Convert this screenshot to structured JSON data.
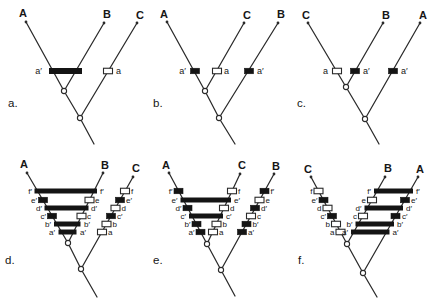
{
  "figure": {
    "colors": {
      "line": "#2a2a2a",
      "black_mark": "#141414",
      "open_mark_fill": "#ffffff",
      "background": "#ffffff"
    },
    "character_rows": {
      "f": 191,
      "e": 200,
      "d": 208,
      "c": 216,
      "b": 224,
      "a": 232
    },
    "panels": [
      {
        "id": "a",
        "row": "top",
        "letter": {
          "t": "a.",
          "x": 8,
          "y": 107
        },
        "tips": [
          {
            "t": "A",
            "tx": 23,
            "ty": 17,
            "px": 26,
            "py": 22
          },
          {
            "t": "B",
            "tx": 107,
            "ty": 18,
            "px": 104,
            "py": 23
          },
          {
            "t": "C",
            "tx": 140,
            "ty": 19,
            "px": 137,
            "py": 23
          }
        ],
        "edges": [
          [
            26,
            22,
            64,
            91
          ],
          [
            104,
            23,
            64,
            91
          ],
          [
            64,
            91,
            80,
            118
          ],
          [
            137,
            23,
            80,
            118
          ],
          [
            80,
            118,
            94,
            144
          ]
        ],
        "nodes": [
          [
            64,
            91
          ],
          [
            80,
            118
          ]
        ],
        "bars": [
          {
            "x1": 49,
            "x2": 82,
            "y": 71,
            "h": 6
          }
        ],
        "marks": [
          {
            "k": "o",
            "x": 108,
            "y": 71
          }
        ],
        "labels": [
          {
            "t": "a′",
            "x": 42,
            "y": 74,
            "a": "e"
          },
          {
            "t": "a",
            "x": 116,
            "y": 74,
            "a": "s"
          }
        ]
      },
      {
        "id": "b",
        "row": "top",
        "letter": {
          "t": "b.",
          "x": 153,
          "y": 107
        },
        "tips": [
          {
            "t": "A",
            "tx": 164,
            "ty": 18,
            "px": 167,
            "py": 22
          },
          {
            "t": "C",
            "tx": 247,
            "ty": 19,
            "px": 244,
            "py": 23
          },
          {
            "t": "B",
            "tx": 281,
            "ty": 18,
            "px": 278,
            "py": 23
          }
        ],
        "edges": [
          [
            167,
            22,
            205,
            91
          ],
          [
            244,
            23,
            205,
            91
          ],
          [
            205,
            91,
            219,
            118
          ],
          [
            278,
            23,
            219,
            118
          ],
          [
            219,
            118,
            235,
            144
          ]
        ],
        "nodes": [
          [
            205,
            91
          ],
          [
            219,
            118
          ]
        ],
        "bars": [],
        "marks": [
          {
            "k": "b",
            "x": 195,
            "y": 71
          },
          {
            "k": "o",
            "x": 217,
            "y": 71
          },
          {
            "k": "b",
            "x": 249,
            "y": 71
          }
        ],
        "labels": [
          {
            "t": "a′",
            "x": 186,
            "y": 74,
            "a": "e"
          },
          {
            "t": "a",
            "x": 224,
            "y": 74,
            "a": "s"
          },
          {
            "t": "a′",
            "x": 257,
            "y": 74,
            "a": "s"
          }
        ]
      },
      {
        "id": "c",
        "row": "top",
        "letter": {
          "t": "c.",
          "x": 297,
          "y": 107
        },
        "tips": [
          {
            "t": "C",
            "tx": 306,
            "ty": 19,
            "px": 308,
            "py": 23
          },
          {
            "t": "B",
            "tx": 386,
            "ty": 19,
            "px": 383,
            "py": 23
          },
          {
            "t": "A",
            "tx": 423,
            "ty": 19,
            "px": 420,
            "py": 23
          }
        ],
        "edges": [
          [
            308,
            23,
            346,
            87
          ],
          [
            383,
            23,
            346,
            87
          ],
          [
            346,
            87,
            365,
            119
          ],
          [
            420,
            23,
            365,
            119
          ],
          [
            365,
            119,
            379,
            144
          ]
        ],
        "nodes": [
          [
            346,
            87
          ],
          [
            365,
            119
          ]
        ],
        "bars": [],
        "marks": [
          {
            "k": "o",
            "x": 337,
            "y": 71
          },
          {
            "k": "b",
            "x": 355,
            "y": 71
          },
          {
            "k": "b",
            "x": 393,
            "y": 71
          }
        ],
        "labels": [
          {
            "t": "a",
            "x": 328,
            "y": 74,
            "a": "e"
          },
          {
            "t": "a′",
            "x": 363,
            "y": 74,
            "a": "s"
          },
          {
            "t": "a′",
            "x": 401,
            "y": 74,
            "a": "s"
          }
        ]
      },
      {
        "id": "d",
        "row": "bottom",
        "letter": {
          "t": "d.",
          "x": 5,
          "y": 264
        },
        "tips": [
          {
            "t": "A",
            "tx": 24,
            "ty": 168,
            "px": 27,
            "py": 173
          },
          {
            "t": "B",
            "tx": 105,
            "ty": 169,
            "px": 103,
            "py": 173
          },
          {
            "t": "C",
            "tx": 136,
            "ty": 172,
            "px": 133,
            "py": 177
          }
        ],
        "edges": [
          [
            27,
            173,
            68,
            243
          ],
          [
            103,
            173,
            68,
            243
          ],
          [
            68,
            243,
            81,
            269
          ],
          [
            133,
            177,
            81,
            269
          ],
          [
            81,
            269,
            97,
            297
          ]
        ],
        "nodes": [
          [
            68,
            243
          ],
          [
            81,
            269
          ]
        ],
        "bars": [
          {
            "x1": 34.5,
            "x2": 97,
            "y": 191
          },
          {
            "x1": 44.5,
            "x2": 88.5,
            "y": 208
          },
          {
            "x1": 54,
            "x2": 80.5,
            "y": 224
          },
          {
            "x1": 58.5,
            "x2": 76.5,
            "y": 232
          }
        ],
        "marks": [
          {
            "k": "b",
            "x": 43,
            "y": 200
          },
          {
            "k": "b",
            "x": 52,
            "y": 216
          },
          {
            "k": "o",
            "x": 89.5,
            "y": 200
          },
          {
            "k": "o",
            "x": 81.5,
            "y": 216
          },
          {
            "k": "o",
            "x": 125,
            "y": 191
          },
          {
            "k": "b",
            "x": 120,
            "y": 200
          },
          {
            "k": "o",
            "x": 115.5,
            "y": 208
          },
          {
            "k": "b",
            "x": 111,
            "y": 216
          },
          {
            "k": "o",
            "x": 106.5,
            "y": 224
          },
          {
            "k": "o",
            "x": 102,
            "y": 232
          }
        ],
        "labels": [
          {
            "t": "f′",
            "x": 32,
            "y": 194,
            "a": "e"
          },
          {
            "t": "e′",
            "x": 37,
            "y": 203,
            "a": "e"
          },
          {
            "t": "d′",
            "x": 42,
            "y": 211,
            "a": "e"
          },
          {
            "t": "c′",
            "x": 46,
            "y": 219,
            "a": "e"
          },
          {
            "t": "b′",
            "x": 51,
            "y": 227,
            "a": "e"
          },
          {
            "t": "a′",
            "x": 55,
            "y": 235,
            "a": "e"
          },
          {
            "t": "f′",
            "x": 100,
            "y": 194,
            "a": "s"
          },
          {
            "t": "e",
            "x": 95,
            "y": 203,
            "a": "s"
          },
          {
            "t": "d′",
            "x": 91,
            "y": 211,
            "a": "s"
          },
          {
            "t": "c",
            "x": 87,
            "y": 219,
            "a": "s"
          },
          {
            "t": "b′",
            "x": 84,
            "y": 227,
            "a": "s"
          },
          {
            "t": "a′",
            "x": 80,
            "y": 235,
            "a": "s"
          },
          {
            "t": "f",
            "x": 131,
            "y": 194,
            "a": "s"
          },
          {
            "t": "e′",
            "x": 126,
            "y": 203,
            "a": "s"
          },
          {
            "t": "d",
            "x": 121.5,
            "y": 211,
            "a": "s"
          },
          {
            "t": "c′",
            "x": 117,
            "y": 219,
            "a": "s"
          },
          {
            "t": "b",
            "x": 112.5,
            "y": 227,
            "a": "s"
          },
          {
            "t": "a",
            "x": 108,
            "y": 235,
            "a": "s"
          }
        ]
      },
      {
        "id": "e",
        "row": "bottom",
        "letter": {
          "t": "e.",
          "x": 153,
          "y": 264
        },
        "tips": [
          {
            "t": "A",
            "tx": 166,
            "ty": 169,
            "px": 169,
            "py": 173
          },
          {
            "t": "C",
            "tx": 242,
            "ty": 169,
            "px": 240,
            "py": 174
          },
          {
            "t": "B",
            "tx": 276,
            "ty": 170,
            "px": 274,
            "py": 174
          }
        ],
        "edges": [
          [
            169,
            173,
            207,
            244
          ],
          [
            240,
            174,
            207,
            244
          ],
          [
            207,
            244,
            221,
            270
          ],
          [
            274,
            174,
            221,
            270
          ],
          [
            221,
            270,
            235,
            296
          ]
        ],
        "nodes": [
          [
            207,
            244
          ],
          [
            221,
            270
          ]
        ],
        "bars": [
          {
            "x1": 180.5,
            "x2": 231,
            "y": 200
          },
          {
            "x1": 189,
            "x2": 223,
            "y": 216
          }
        ],
        "marks": [
          {
            "k": "b",
            "x": 178.5,
            "y": 191
          },
          {
            "k": "b",
            "x": 187.5,
            "y": 208
          },
          {
            "k": "b",
            "x": 196.5,
            "y": 224
          },
          {
            "k": "b",
            "x": 200.5,
            "y": 232
          },
          {
            "k": "o",
            "x": 232,
            "y": 191
          },
          {
            "k": "o",
            "x": 224,
            "y": 208
          },
          {
            "k": "o",
            "x": 216.5,
            "y": 224
          },
          {
            "k": "o",
            "x": 213,
            "y": 232
          },
          {
            "k": "b",
            "x": 264.5,
            "y": 191
          },
          {
            "k": "o",
            "x": 259.5,
            "y": 200
          },
          {
            "k": "b",
            "x": 255,
            "y": 208
          },
          {
            "k": "o",
            "x": 251,
            "y": 216
          },
          {
            "k": "b",
            "x": 246.5,
            "y": 224
          },
          {
            "k": "b",
            "x": 242,
            "y": 232
          }
        ],
        "labels": [
          {
            "t": "f′",
            "x": 172.5,
            "y": 194,
            "a": "e"
          },
          {
            "t": "e′",
            "x": 177.5,
            "y": 203,
            "a": "e"
          },
          {
            "t": "d′",
            "x": 181.5,
            "y": 211,
            "a": "e"
          },
          {
            "t": "c′",
            "x": 186,
            "y": 219,
            "a": "e"
          },
          {
            "t": "b′",
            "x": 190.5,
            "y": 227,
            "a": "e"
          },
          {
            "t": "a′",
            "x": 194.5,
            "y": 235,
            "a": "e"
          },
          {
            "t": "f",
            "x": 238,
            "y": 194,
            "a": "s"
          },
          {
            "t": "e′",
            "x": 234,
            "y": 203,
            "a": "s"
          },
          {
            "t": "d",
            "x": 230,
            "y": 211,
            "a": "s"
          },
          {
            "t": "c′",
            "x": 226,
            "y": 219,
            "a": "s"
          },
          {
            "t": "b",
            "x": 222.5,
            "y": 227,
            "a": "s"
          },
          {
            "t": "a",
            "x": 219,
            "y": 235,
            "a": "s"
          },
          {
            "t": "f′",
            "x": 270.5,
            "y": 194,
            "a": "s"
          },
          {
            "t": "e",
            "x": 265.5,
            "y": 203,
            "a": "s"
          },
          {
            "t": "d′",
            "x": 261,
            "y": 211,
            "a": "s"
          },
          {
            "t": "c",
            "x": 257,
            "y": 219,
            "a": "s"
          },
          {
            "t": "b′",
            "x": 252.5,
            "y": 227,
            "a": "s"
          },
          {
            "t": "a′",
            "x": 248,
            "y": 235,
            "a": "s"
          }
        ]
      },
      {
        "id": "f",
        "row": "bottom",
        "letter": {
          "t": "f.",
          "x": 298,
          "y": 264
        },
        "tips": [
          {
            "t": "C",
            "tx": 308,
            "ty": 173,
            "px": 311,
            "py": 177
          },
          {
            "t": "B",
            "tx": 388,
            "ty": 172,
            "px": 385,
            "py": 177
          },
          {
            "t": "A",
            "tx": 420,
            "ty": 173,
            "px": 418,
            "py": 177
          }
        ],
        "edges": [
          [
            311,
            177,
            347,
            244
          ],
          [
            385,
            177,
            347,
            244
          ],
          [
            347,
            244,
            363,
            273
          ],
          [
            418,
            177,
            363,
            273
          ],
          [
            363,
            273,
            377,
            297
          ]
        ],
        "nodes": [
          [
            347,
            244
          ],
          [
            363,
            273
          ]
        ],
        "bars": [
          {
            "x1": 374,
            "x2": 413,
            "y": 191
          },
          {
            "x1": 364.5,
            "x2": 403,
            "y": 208
          },
          {
            "x1": 355.5,
            "x2": 394,
            "y": 224
          },
          {
            "x1": 351,
            "x2": 389.5,
            "y": 232
          }
        ],
        "marks": [
          {
            "k": "o",
            "x": 318.5,
            "y": 191
          },
          {
            "k": "b",
            "x": 323.5,
            "y": 200
          },
          {
            "k": "o",
            "x": 327.5,
            "y": 208
          },
          {
            "k": "b",
            "x": 332,
            "y": 216
          },
          {
            "k": "o",
            "x": 336,
            "y": 224
          },
          {
            "k": "o",
            "x": 340.5,
            "y": 232
          },
          {
            "k": "o",
            "x": 372,
            "y": 200
          },
          {
            "k": "o",
            "x": 363,
            "y": 216
          },
          {
            "k": "b",
            "x": 405,
            "y": 200
          },
          {
            "k": "b",
            "x": 395.5,
            "y": 216
          }
        ],
        "labels": [
          {
            "t": "f",
            "x": 312.5,
            "y": 194,
            "a": "e"
          },
          {
            "t": "e′",
            "x": 317.5,
            "y": 203,
            "a": "e"
          },
          {
            "t": "d",
            "x": 321.5,
            "y": 211,
            "a": "e"
          },
          {
            "t": "c′",
            "x": 326,
            "y": 219,
            "a": "e"
          },
          {
            "t": "b",
            "x": 330,
            "y": 227,
            "a": "e"
          },
          {
            "t": "a",
            "x": 334.5,
            "y": 235,
            "a": "e"
          },
          {
            "t": "f′",
            "x": 371,
            "y": 194,
            "a": "e"
          },
          {
            "t": "e",
            "x": 366,
            "y": 203,
            "a": "e"
          },
          {
            "t": "d′",
            "x": 361.5,
            "y": 211,
            "a": "e"
          },
          {
            "t": "c",
            "x": 357,
            "y": 219,
            "a": "e"
          },
          {
            "t": "b′",
            "x": 352.5,
            "y": 227,
            "a": "e"
          },
          {
            "t": "a′",
            "x": 348,
            "y": 235,
            "a": "e"
          },
          {
            "t": "f′",
            "x": 416,
            "y": 194,
            "a": "s"
          },
          {
            "t": "e′",
            "x": 411,
            "y": 203,
            "a": "s"
          },
          {
            "t": "d′",
            "x": 406,
            "y": 211,
            "a": "s"
          },
          {
            "t": "c′",
            "x": 402,
            "y": 219,
            "a": "s"
          },
          {
            "t": "b′",
            "x": 397,
            "y": 227,
            "a": "s"
          },
          {
            "t": "a′",
            "x": 392.5,
            "y": 235,
            "a": "s"
          }
        ]
      }
    ]
  }
}
